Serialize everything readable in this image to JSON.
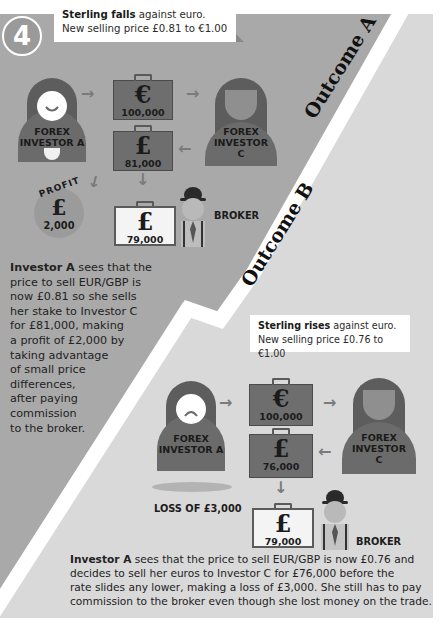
{
  "step_number": "4",
  "colors": {
    "outcome_a_bg": "#a9a9a9",
    "outcome_b_bg": "#d9d9d9",
    "divider": "#ffffff",
    "investor_body": "#6b6b6b",
    "case_dark": "#6e6e6e",
    "case_light": "#f4f4f4"
  },
  "outcome_a": {
    "heading": "Outcome A",
    "callout": {
      "bold": "Sterling falls",
      "rest": " against euro.",
      "line2": "New selling price £0.81 to €1.00"
    },
    "investor_a_label": [
      "FOREX",
      "INVESTOR A"
    ],
    "investor_c_label": [
      "FOREX",
      "INVESTOR",
      "C"
    ],
    "case_euro": {
      "icon": "euro-icon",
      "symbol": "€",
      "amount": "100,000"
    },
    "case_pound": {
      "icon": "pound-icon",
      "symbol": "£",
      "amount": "81,000"
    },
    "case_broker": {
      "icon": "pound-icon",
      "symbol": "£",
      "amount": "79,000"
    },
    "profit": {
      "label": "PROFIT",
      "symbol": "£",
      "amount": "2,000"
    },
    "broker_label": "BROKER",
    "description": {
      "bold": "Investor A",
      "lines": [
        " sees that the",
        "price to sell EUR/GBP is",
        "now £0.81 so she sells",
        "her stake to Investor C",
        "for £81,000, making",
        "a profit of £2,000 by",
        "taking advantage",
        "of small price",
        "differences,",
        "after paying",
        "commission",
        "to the broker."
      ]
    }
  },
  "outcome_b": {
    "heading": "Outcome B",
    "callout": {
      "bold": "Sterling rises",
      "rest": " against euro.",
      "line2": "New selling price £0.76 to €1.00"
    },
    "investor_a_label": [
      "FOREX",
      "INVESTOR A"
    ],
    "investor_c_label": [
      "FOREX",
      "INVESTOR",
      "C"
    ],
    "case_euro": {
      "icon": "euro-icon",
      "symbol": "€",
      "amount": "100,000"
    },
    "case_pound": {
      "icon": "pound-icon",
      "symbol": "£",
      "amount": "76,000"
    },
    "case_broker": {
      "icon": "pound-icon",
      "symbol": "£",
      "amount": "79,000"
    },
    "loss_label": "LOSS OF £3,000",
    "broker_label": "BROKER",
    "description": {
      "bold": "Investor A",
      "lines": [
        " sees that the price to sell EUR/GBP is now £0.76 and",
        "decides to sell her euros to Investor C for £76,000 before the",
        "rate slides any lower, making a loss of £3,000. She still has to pay",
        "commission to the broker even though she lost money on the trade."
      ]
    }
  }
}
